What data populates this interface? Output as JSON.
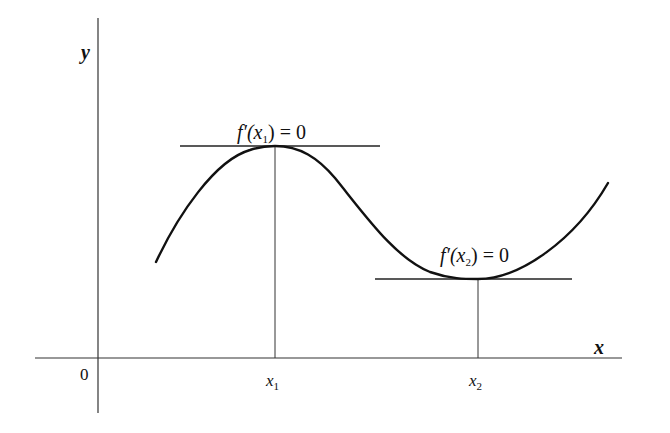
{
  "figure": {
    "axes": {
      "x_label": "x",
      "y_label": "y",
      "origin_label": "0"
    },
    "ticks": [
      {
        "var": "x",
        "sub": "1"
      },
      {
        "var": "x",
        "sub": "2"
      }
    ],
    "annotations": [
      {
        "prefix": "f′(",
        "var": "x",
        "sub": "1",
        "suffix": ") = 0",
        "meaning": "local maximum, horizontal tangent"
      },
      {
        "prefix": "f′(",
        "var": "x",
        "sub": "2",
        "suffix": ") = 0",
        "meaning": "local minimum, horizontal tangent"
      }
    ],
    "colors": {
      "ink": "#111111",
      "background": "#ffffff"
    }
  }
}
